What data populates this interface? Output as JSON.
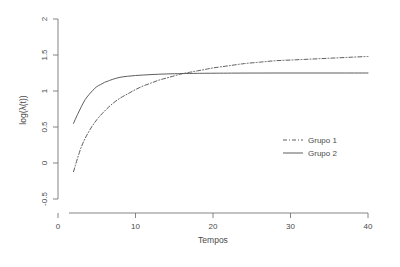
{
  "chart_data": {
    "type": "line",
    "title": "",
    "xlabel": "Tempos",
    "ylabel": "log(λ(t))",
    "xlim": [
      0,
      40
    ],
    "ylim": [
      -0.5,
      2
    ],
    "xticks": [
      "0",
      "10",
      "20",
      "30",
      "40"
    ],
    "xtick_values": [
      0,
      10,
      20,
      30,
      40
    ],
    "yticks": [
      "-0.5",
      "0",
      "0.5",
      "1",
      "1.5",
      "2"
    ],
    "ytick_values": [
      -0.5,
      0,
      0.5,
      1,
      1.5,
      2
    ],
    "grid": false,
    "legend_position": "center-right",
    "series": [
      {
        "name": "Grupo 1",
        "style": "dashdot",
        "color": "#555555",
        "x": [
          2,
          3,
          4,
          5,
          6,
          7,
          8,
          9,
          10,
          11,
          12,
          13,
          14,
          15,
          16,
          17,
          18,
          19,
          20,
          22,
          24,
          26,
          28,
          30,
          32,
          34,
          36,
          38,
          40
        ],
        "values": [
          -0.12,
          0.22,
          0.44,
          0.6,
          0.72,
          0.82,
          0.9,
          0.96,
          1.02,
          1.07,
          1.11,
          1.15,
          1.18,
          1.21,
          1.24,
          1.26,
          1.28,
          1.3,
          1.32,
          1.35,
          1.38,
          1.4,
          1.42,
          1.43,
          1.44,
          1.45,
          1.46,
          1.47,
          1.48
        ]
      },
      {
        "name": "Grupo 2",
        "style": "solid",
        "color": "#555555",
        "x": [
          2,
          2.5,
          3,
          3.5,
          4,
          4.5,
          5,
          5.5,
          6,
          6.5,
          7,
          8,
          9,
          10,
          11,
          12,
          13,
          14,
          15,
          16,
          18,
          20,
          24,
          28,
          32,
          36,
          40
        ],
        "values": [
          0.55,
          0.67,
          0.78,
          0.88,
          0.95,
          1.01,
          1.06,
          1.09,
          1.12,
          1.14,
          1.16,
          1.19,
          1.205,
          1.215,
          1.222,
          1.228,
          1.233,
          1.237,
          1.24,
          1.242,
          1.245,
          1.247,
          1.249,
          1.25,
          1.25,
          1.25,
          1.25
        ]
      }
    ]
  },
  "legend": {
    "entries": [
      {
        "label": "Grupo 1",
        "style": "dashdot"
      },
      {
        "label": "Grupo 2",
        "style": "solid"
      }
    ]
  },
  "colors": {
    "axis": "#777777",
    "line": "#555555",
    "text": "#4a4a4a",
    "background": "#ffffff"
  }
}
